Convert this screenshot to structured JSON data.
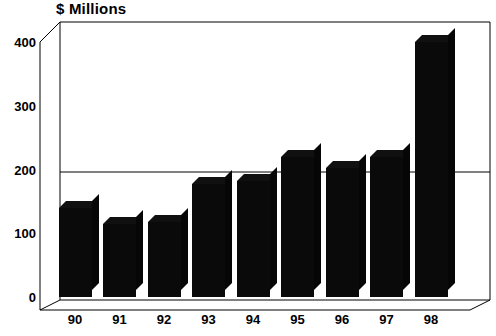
{
  "chart_data": {
    "type": "bar",
    "title": "$ Millions",
    "xlabel": "",
    "ylabel": "",
    "categories": [
      "90",
      "91",
      "92",
      "93",
      "94",
      "95",
      "96",
      "97",
      "98"
    ],
    "values": [
      140,
      115,
      118,
      178,
      182,
      220,
      203,
      220,
      400
    ],
    "ylim": [
      0,
      400
    ],
    "yticks": [
      0,
      100,
      200,
      300,
      400
    ],
    "ytick_labels": [
      "0",
      "100",
      "200",
      "300",
      "400"
    ],
    "grid": false,
    "legend": null,
    "style": "3d-bar",
    "bar_color": "#0a0a0a",
    "axis_color": "#000000",
    "background": "#ffffff"
  }
}
